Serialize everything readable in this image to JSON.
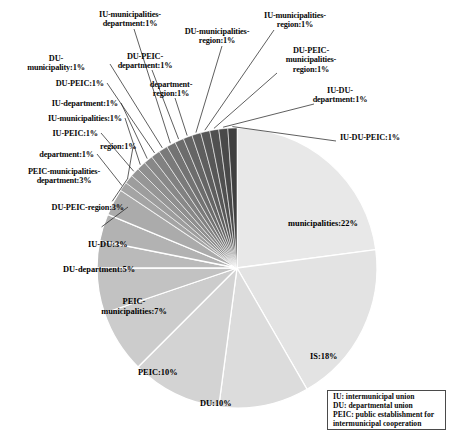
{
  "chart_data": {
    "type": "pie",
    "title": "",
    "subtitle": "",
    "xlabel": "",
    "ylabel": "",
    "legend_position": "bottom-right",
    "grid": false,
    "start_angle_deg": 0,
    "direction": "clockwise",
    "total_percent": 100,
    "categories": [
      "municipalities",
      "IS",
      "DU",
      "PEIC",
      "PEIC-municipalities",
      "DU-department",
      "IU-DU",
      "DU-PEIC-region",
      "PEIC-municipalities-department",
      "department",
      "region",
      "IU-PEIC",
      "IU-municipalities",
      "IU-department",
      "DU-PEIC",
      "DU-municipality",
      "IU-municipalities-department",
      "DU-PEIC-department",
      "department-region",
      "DU-municipalities-region",
      "IU-municipalities-region",
      "DU-PEIC-municipalities-region",
      "IU-DU-department",
      "IU-DU-PEIC"
    ],
    "values": [
      22,
      18,
      10,
      10,
      7,
      5,
      3,
      3,
      3,
      1,
      1,
      1,
      1,
      1,
      1,
      1,
      1,
      1,
      1,
      1,
      1,
      1,
      1,
      1
    ],
    "slices": [
      {
        "label": "municipalities",
        "value": 22,
        "display": "municipalities:22%",
        "color": "#e8e8e8",
        "placement": "inside"
      },
      {
        "label": "IS",
        "value": 18,
        "display": "IS:18%",
        "color": "#e3e3e3",
        "placement": "inside"
      },
      {
        "label": "DU",
        "value": 10,
        "display": "DU:10%",
        "color": "#dcdcdc",
        "placement": "inside"
      },
      {
        "label": "PEIC",
        "value": 10,
        "display": "PEIC:10%",
        "color": "#d3d3d3",
        "placement": "inside"
      },
      {
        "label": "PEIC-municipalities",
        "value": 7,
        "display": "PEIC-\nmunicipalities:7%",
        "color": "#cccccc",
        "placement": "inside"
      },
      {
        "label": "DU-department",
        "value": 5,
        "display": "DU-department:5%",
        "color": "#c2c2c2",
        "placement": "inside"
      },
      {
        "label": "IU-DU",
        "value": 3,
        "display": "IU-DU:3%",
        "color": "#bababa",
        "placement": "inside"
      },
      {
        "label": "DU-PEIC-region",
        "value": 3,
        "display": "DU-PEIC-region:3%",
        "color": "#b2b2b2",
        "placement": "outside"
      },
      {
        "label": "PEIC-municipalities-department",
        "value": 3,
        "display": "PEIC-municipalities-\ndepartment:3%",
        "color": "#ababab",
        "placement": "outside"
      },
      {
        "label": "department",
        "value": 1,
        "display": "department:1%",
        "color": "#a4a4a4",
        "placement": "outside"
      },
      {
        "label": "region",
        "value": 1,
        "display": "region:1%",
        "color": "#9d9d9d",
        "placement": "outside"
      },
      {
        "label": "IU-PEIC",
        "value": 1,
        "display": "IU-PEIC:1%",
        "color": "#969696",
        "placement": "outside"
      },
      {
        "label": "IU-municipalities",
        "value": 1,
        "display": "IU-municipalities:1%",
        "color": "#8f8f8f",
        "placement": "outside"
      },
      {
        "label": "IU-department",
        "value": 1,
        "display": "IU-department:1%",
        "color": "#888888",
        "placement": "outside"
      },
      {
        "label": "DU-PEIC",
        "value": 1,
        "display": "DU-PEIC:1%",
        "color": "#818181",
        "placement": "outside"
      },
      {
        "label": "DU-municipality",
        "value": 1,
        "display": "DU-\nmunicipality:1%",
        "color": "#7a7a7a",
        "placement": "outside"
      },
      {
        "label": "IU-municipalities-department",
        "value": 1,
        "display": "IU-municipalities-\ndepartment:1%",
        "color": "#737373",
        "placement": "outside"
      },
      {
        "label": "DU-PEIC-department",
        "value": 1,
        "display": "DU-PEIC-\ndepartment:1%",
        "color": "#6c6c6c",
        "placement": "outside"
      },
      {
        "label": "department-region",
        "value": 1,
        "display": "department-\nregion:1%",
        "color": "#656565",
        "placement": "outside"
      },
      {
        "label": "DU-municipalities-region",
        "value": 1,
        "display": "DU-municipalities-\nregion:1%",
        "color": "#5e5e5e",
        "placement": "outside"
      },
      {
        "label": "IU-municipalities-region",
        "value": 1,
        "display": "IU-municipalities-\nregion:1%",
        "color": "#575757",
        "placement": "outside"
      },
      {
        "label": "DU-PEIC-municipalities-region",
        "value": 1,
        "display": "DU-PEIC-\nmunicipalities-\nregion:1%",
        "color": "#505050",
        "placement": "outside"
      },
      {
        "label": "IU-DU-department",
        "value": 1,
        "display": "IU-DU-\ndepartment:1%",
        "color": "#494949",
        "placement": "outside"
      },
      {
        "label": "IU-DU-PEIC",
        "value": 1,
        "display": "IU-DU-PEIC:1%",
        "color": "#3f3f3f",
        "placement": "outside"
      }
    ]
  },
  "labels": {
    "municipalities": "municipalities:22%",
    "is": "IS:18%",
    "du": "DU:10%",
    "peic": "PEIC:10%",
    "peic_municipalities": "PEIC-\nmunicipalities:7%",
    "du_department": "DU-department:5%",
    "iu_du": "IU-DU:3%",
    "du_peic_region": "DU-PEIC-region:3%",
    "peic_municipalities_department": "PEIC-municipalities-\ndepartment:3%",
    "department": "department:1%",
    "region": "region:1%",
    "iu_peic": "IU-PEIC:1%",
    "iu_municipalities": "IU-municipalities:1%",
    "iu_department": "IU-department:1%",
    "du_peic": "DU-PEIC:1%",
    "du_municipality": "DU-\nmunicipality:1%",
    "iu_municipalities_department": "IU-municipalities-\ndepartment:1%",
    "du_peic_department": "DU-PEIC-\ndepartment:1%",
    "department_region": "department-\nregion:1%",
    "du_municipalities_region": "DU-municipalities-\nregion:1%",
    "iu_municipalities_region": "IU-municipalities-\nregion:1%",
    "du_peic_municipalities_region": "DU-PEIC-\nmunicipalities-\nregion:1%",
    "iu_du_department": "IU-DU-\ndepartment:1%",
    "iu_du_peic": "IU-DU-PEIC:1%"
  },
  "legend": {
    "lines": [
      "IU: intermunicipal union",
      "DU: departmental union",
      "PEIC: public establishment for",
      "intermunicipal cooperation"
    ]
  },
  "colors": {
    "lightest_slice": "#e8e8e8",
    "darkest_slice": "#3f3f3f",
    "slice_border": "#ffffff",
    "leader_line": "#1a1a1a",
    "legend_border": "#4a4a4a",
    "text": "#0a0a0a",
    "background": "#ffffff"
  },
  "geometry": {
    "center_x": 237,
    "center_y": 268,
    "radius": 140
  }
}
